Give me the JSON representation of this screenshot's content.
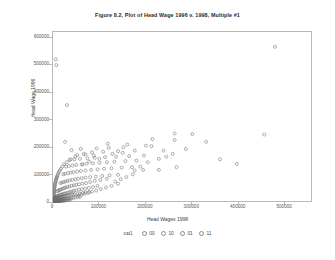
{
  "chart_data": {
    "type": "scatter",
    "title": "Figure 8.2, Plot of Head Wage 1996 v. 1998, Multiple #1",
    "xlabel": "Head Wages 1998",
    "ylabel": "Head Wage 1996",
    "xlim": [
      0,
      560000
    ],
    "ylim": [
      0,
      620000
    ],
    "xticks": [
      0,
      100000,
      200000,
      300000,
      400000,
      500000
    ],
    "xtick_labels": [
      "0",
      "100000",
      "200000",
      "300000",
      "400000",
      "500000"
    ],
    "yticks": [
      0,
      100000,
      200000,
      300000,
      400000,
      500000,
      600000
    ],
    "ytick_labels": [
      "0",
      "100000",
      "200000",
      "300000",
      "400000",
      "500000",
      "600000"
    ],
    "grid": false,
    "marker": "open-circle",
    "marker_color": "#6e6e6e",
    "legend_position": "bottom",
    "legend_title": "cat1",
    "legend_entries": [
      "00",
      "10",
      "01",
      "11"
    ],
    "points": [
      [
        478000,
        566000
      ],
      [
        6000,
        521000
      ],
      [
        7000,
        500000
      ],
      [
        30000,
        355000
      ],
      [
        262000,
        252000
      ],
      [
        300000,
        250000
      ],
      [
        455000,
        248000
      ],
      [
        214000,
        232000
      ],
      [
        262000,
        228000
      ],
      [
        330000,
        222000
      ],
      [
        26000,
        222000
      ],
      [
        118000,
        215000
      ],
      [
        160000,
        212000
      ],
      [
        200000,
        208000
      ],
      [
        212000,
        206000
      ],
      [
        152000,
        202000
      ],
      [
        120000,
        200000
      ],
      [
        94000,
        198000
      ],
      [
        60000,
        196000
      ],
      [
        40000,
        192000
      ],
      [
        176000,
        190000
      ],
      [
        140000,
        188000
      ],
      [
        108000,
        186000
      ],
      [
        84000,
        184000
      ],
      [
        150000,
        182000
      ],
      [
        128000,
        178000
      ],
      [
        70000,
        176000
      ],
      [
        52000,
        174000
      ],
      [
        196000,
        172000
      ],
      [
        164000,
        170000
      ],
      [
        136000,
        168000
      ],
      [
        112000,
        166000
      ],
      [
        90000,
        164000
      ],
      [
        74000,
        162000
      ],
      [
        58000,
        160000
      ],
      [
        46000,
        158000
      ],
      [
        36000,
        156000
      ],
      [
        180000,
        154000
      ],
      [
        156000,
        152000
      ],
      [
        132000,
        150000
      ],
      [
        116000,
        148000
      ],
      [
        100000,
        146000
      ],
      [
        86000,
        144000
      ],
      [
        72000,
        142000
      ],
      [
        62000,
        140000
      ],
      [
        50000,
        138000
      ],
      [
        42000,
        136000
      ],
      [
        34000,
        134000
      ],
      [
        28000,
        132000
      ],
      [
        170000,
        130000
      ],
      [
        148000,
        128000
      ],
      [
        126000,
        126000
      ],
      [
        110000,
        124000
      ],
      [
        96000,
        122000
      ],
      [
        82000,
        120000
      ],
      [
        70000,
        118000
      ],
      [
        60000,
        116000
      ],
      [
        52000,
        114000
      ],
      [
        44000,
        112000
      ],
      [
        38000,
        110000
      ],
      [
        32000,
        108000
      ],
      [
        26000,
        106000
      ],
      [
        22000,
        104000
      ],
      [
        140000,
        102000
      ],
      [
        122000,
        100000
      ],
      [
        106000,
        98000
      ],
      [
        92000,
        96000
      ],
      [
        80000,
        94000
      ],
      [
        70000,
        92000
      ],
      [
        62000,
        90000
      ],
      [
        54000,
        88000
      ],
      [
        48000,
        86000
      ],
      [
        42000,
        84000
      ],
      [
        36000,
        82000
      ],
      [
        31000,
        80000
      ],
      [
        27000,
        78000
      ],
      [
        23000,
        76000
      ],
      [
        19000,
        74000
      ],
      [
        16000,
        72000
      ],
      [
        116000,
        88000
      ],
      [
        102000,
        84000
      ],
      [
        90000,
        80000
      ],
      [
        80000,
        76000
      ],
      [
        71000,
        72000
      ],
      [
        63000,
        70000
      ],
      [
        56000,
        68000
      ],
      [
        50000,
        66000
      ],
      [
        45000,
        64000
      ],
      [
        40000,
        62000
      ],
      [
        35000,
        60000
      ],
      [
        31000,
        58000
      ],
      [
        27000,
        56000
      ],
      [
        24000,
        54000
      ],
      [
        21000,
        52000
      ],
      [
        18000,
        50000
      ],
      [
        15000,
        48000
      ],
      [
        13000,
        46000
      ],
      [
        11000,
        44000
      ],
      [
        9000,
        42000
      ],
      [
        96000,
        62000
      ],
      [
        86000,
        58000
      ],
      [
        77000,
        55000
      ],
      [
        69000,
        52000
      ],
      [
        62000,
        50000
      ],
      [
        56000,
        48000
      ],
      [
        50000,
        46000
      ],
      [
        45000,
        44000
      ],
      [
        41000,
        42000
      ],
      [
        37000,
        40000
      ],
      [
        33000,
        38000
      ],
      [
        30000,
        36000
      ],
      [
        27000,
        35000
      ],
      [
        24000,
        34000
      ],
      [
        21000,
        32000
      ],
      [
        19000,
        31000
      ],
      [
        17000,
        30000
      ],
      [
        15000,
        28000
      ],
      [
        13000,
        27000
      ],
      [
        11000,
        26000
      ],
      [
        9500,
        25000
      ],
      [
        8000,
        24000
      ],
      [
        7000,
        22000
      ],
      [
        6000,
        21000
      ],
      [
        5000,
        20000
      ],
      [
        4200,
        18000
      ],
      [
        3500,
        17000
      ],
      [
        3000,
        16000
      ],
      [
        2500,
        15000
      ],
      [
        2000,
        14000
      ],
      [
        78000,
        40000
      ],
      [
        70000,
        38000
      ],
      [
        64000,
        36000
      ],
      [
        58000,
        34000
      ],
      [
        52000,
        32000
      ],
      [
        47000,
        31000
      ],
      [
        43000,
        30000
      ],
      [
        39000,
        29000
      ],
      [
        35000,
        28000
      ],
      [
        32000,
        27000
      ],
      [
        29000,
        26000
      ],
      [
        26000,
        25000
      ],
      [
        24000,
        24000
      ],
      [
        22000,
        23000
      ],
      [
        20000,
        22000
      ],
      [
        18000,
        21000
      ],
      [
        16500,
        20000
      ],
      [
        15000,
        19000
      ],
      [
        13500,
        18000
      ],
      [
        12000,
        17500
      ],
      [
        11000,
        17000
      ],
      [
        10000,
        16000
      ],
      [
        9000,
        15500
      ],
      [
        8200,
        15000
      ],
      [
        7400,
        14000
      ],
      [
        6600,
        13500
      ],
      [
        6000,
        13000
      ],
      [
        5400,
        12000
      ],
      [
        4800,
        11500
      ],
      [
        4300,
        11000
      ],
      [
        3800,
        10500
      ],
      [
        3400,
        10000
      ],
      [
        3000,
        9500
      ],
      [
        2700,
        9000
      ],
      [
        2400,
        8500
      ],
      [
        2100,
        8000
      ],
      [
        1800,
        7500
      ],
      [
        1600,
        7000
      ],
      [
        1400,
        6500
      ],
      [
        1200,
        6000
      ],
      [
        1000,
        5500
      ],
      [
        900,
        5000
      ],
      [
        800,
        4500
      ],
      [
        700,
        4000
      ],
      [
        600,
        3500
      ],
      [
        500,
        3000
      ],
      [
        58000,
        22000
      ],
      [
        53000,
        21000
      ],
      [
        48000,
        20000
      ],
      [
        44000,
        19000
      ],
      [
        40000,
        18000
      ],
      [
        36000,
        17000
      ],
      [
        33000,
        16000
      ],
      [
        30000,
        15000
      ],
      [
        27000,
        14500
      ],
      [
        25000,
        14000
      ],
      [
        23000,
        13000
      ],
      [
        21000,
        12500
      ],
      [
        19000,
        12000
      ],
      [
        17500,
        11500
      ],
      [
        16000,
        11000
      ],
      [
        14500,
        10500
      ],
      [
        13000,
        10000
      ],
      [
        12000,
        9500
      ],
      [
        11000,
        9000
      ],
      [
        10000,
        8800
      ],
      [
        9200,
        8500
      ],
      [
        8400,
        8000
      ],
      [
        7600,
        7800
      ],
      [
        7000,
        7500
      ],
      [
        6400,
        7000
      ],
      [
        5800,
        6800
      ],
      [
        5300,
        6500
      ],
      [
        4800,
        6200
      ],
      [
        4400,
        6000
      ],
      [
        4000,
        5800
      ],
      [
        3600,
        5500
      ],
      [
        3300,
        5200
      ],
      [
        3000,
        5000
      ],
      [
        2700,
        4800
      ],
      [
        2450,
        4500
      ],
      [
        2200,
        4200
      ],
      [
        2000,
        4000
      ],
      [
        1800,
        3800
      ],
      [
        1600,
        3500
      ],
      [
        1450,
        3300
      ],
      [
        1300,
        3000
      ],
      [
        1150,
        2800
      ],
      [
        1000,
        2600
      ],
      [
        880,
        2400
      ],
      [
        780,
        2200
      ],
      [
        680,
        2000
      ],
      [
        600,
        1800
      ],
      [
        520,
        1600
      ],
      [
        450,
        1400
      ],
      [
        390,
        1200
      ],
      [
        330,
        1000
      ],
      [
        280,
        850
      ],
      [
        240,
        700
      ],
      [
        200,
        600
      ],
      [
        170,
        500
      ],
      [
        140,
        400
      ],
      [
        120,
        300
      ],
      [
        100,
        250
      ],
      [
        80,
        200
      ],
      [
        60,
        150
      ],
      [
        45,
        100
      ],
      [
        30,
        60
      ],
      [
        20,
        40
      ],
      [
        12,
        20
      ],
      [
        8,
        10
      ],
      [
        5,
        5
      ],
      [
        38000,
        12000
      ],
      [
        34000,
        11000
      ],
      [
        31000,
        10000
      ],
      [
        28000,
        9500
      ],
      [
        25500,
        9000
      ],
      [
        23000,
        8500
      ],
      [
        21000,
        8000
      ],
      [
        19000,
        7600
      ],
      [
        17000,
        7200
      ],
      [
        15500,
        6800
      ],
      [
        14000,
        6400
      ],
      [
        12800,
        6000
      ],
      [
        11600,
        5700
      ],
      [
        10500,
        5400
      ],
      [
        9500,
        5100
      ],
      [
        8600,
        4800
      ],
      [
        7800,
        4500
      ],
      [
        7100,
        4300
      ],
      [
        6400,
        4000
      ],
      [
        5800,
        3800
      ],
      [
        5200,
        3600
      ],
      [
        4700,
        3400
      ],
      [
        4250,
        3200
      ],
      [
        3850,
        3000
      ],
      [
        3500,
        2850
      ],
      [
        3150,
        2700
      ],
      [
        2850,
        2550
      ],
      [
        2580,
        2400
      ],
      [
        2330,
        2250
      ],
      [
        2100,
        2100
      ],
      [
        1900,
        1950
      ],
      [
        1720,
        1800
      ],
      [
        1550,
        1700
      ],
      [
        1400,
        1600
      ],
      [
        1270,
        1500
      ],
      [
        1150,
        1400
      ],
      [
        1040,
        1300
      ],
      [
        940,
        1200
      ],
      [
        850,
        1100
      ],
      [
        770,
        1000
      ],
      [
        690,
        920
      ],
      [
        620,
        850
      ],
      [
        560,
        780
      ],
      [
        505,
        700
      ],
      [
        455,
        640
      ],
      [
        410,
        580
      ],
      [
        370,
        520
      ],
      [
        330,
        470
      ],
      [
        300,
        420
      ],
      [
        270,
        380
      ],
      [
        245,
        340
      ],
      [
        220,
        300
      ],
      [
        198,
        270
      ],
      [
        178,
        240
      ],
      [
        160,
        210
      ],
      [
        144,
        185
      ],
      [
        130,
        160
      ],
      [
        117,
        140
      ],
      [
        105,
        120
      ],
      [
        95,
        100
      ],
      [
        140000,
        70000
      ],
      [
        126000,
        62000
      ],
      [
        114000,
        56000
      ],
      [
        103000,
        50000
      ],
      [
        93000,
        45000
      ],
      [
        84000,
        41000
      ],
      [
        76000,
        37000
      ],
      [
        68000,
        33000
      ],
      [
        61000,
        30000
      ],
      [
        55000,
        27000
      ],
      [
        176000,
        118000
      ],
      [
        188000,
        132000
      ],
      [
        204000,
        148000
      ],
      [
        228000,
        160000
      ],
      [
        244000,
        168000
      ],
      [
        258000,
        178000
      ],
      [
        238000,
        190000
      ],
      [
        286000,
        196000
      ],
      [
        194000,
        120000
      ],
      [
        172000,
        104000
      ],
      [
        158000,
        94000
      ],
      [
        146000,
        86000
      ],
      [
        134000,
        78000
      ],
      [
        100000,
        160000
      ],
      [
        78000,
        150000
      ],
      [
        64000,
        140000
      ],
      [
        88000,
        172000
      ],
      [
        66000,
        178000
      ],
      [
        48000,
        168000
      ],
      [
        38000,
        158000
      ],
      [
        30000,
        148000
      ],
      [
        24000,
        140000
      ],
      [
        20000,
        132000
      ],
      [
        17000,
        124000
      ],
      [
        14500,
        118000
      ],
      [
        12500,
        112000
      ],
      [
        11000,
        106000
      ],
      [
        9800,
        100000
      ],
      [
        8800,
        96000
      ],
      [
        8000,
        92000
      ],
      [
        7200,
        88000
      ],
      [
        6500,
        84000
      ],
      [
        5900,
        80000
      ],
      [
        5300,
        76000
      ],
      [
        4800,
        72000
      ],
      [
        4300,
        68000
      ],
      [
        3900,
        64000
      ],
      [
        3500,
        60000
      ],
      [
        3200,
        56000
      ],
      [
        2900,
        52000
      ],
      [
        2600,
        48000
      ],
      [
        2350,
        44000
      ],
      [
        2100,
        40000
      ],
      [
        1900,
        36000
      ],
      [
        1700,
        33000
      ],
      [
        1500,
        30000
      ],
      [
        1350,
        27000
      ],
      [
        1200,
        24000
      ],
      [
        1080,
        21000
      ],
      [
        960,
        19000
      ],
      [
        860,
        17000
      ],
      [
        770,
        15000
      ],
      [
        690,
        13000
      ],
      [
        620,
        11500
      ],
      [
        550,
        10000
      ],
      [
        490,
        8800
      ],
      [
        440,
        7600
      ],
      [
        390,
        6600
      ],
      [
        350,
        5600
      ],
      [
        310,
        4800
      ],
      [
        360000,
        158000
      ],
      [
        396000,
        142000
      ],
      [
        228000,
        120000
      ],
      [
        266000,
        130000
      ]
    ]
  }
}
